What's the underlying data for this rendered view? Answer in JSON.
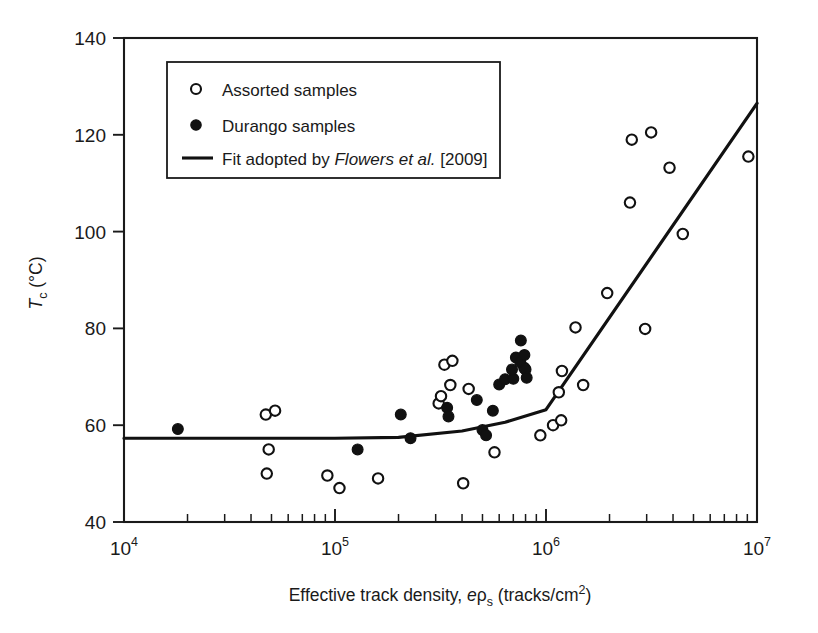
{
  "chart_data": {
    "type": "scatter",
    "title": "",
    "xlabel_parts": {
      "pre": "Effective track density, ",
      "e": "e",
      "rho": "ρ",
      "sub": "s",
      "post": " (tracks/cm",
      "sup": "2",
      "close": ")"
    },
    "xlabel": "Effective track density, eρs (tracks/cm2)",
    "ylabel_parts": {
      "t": "T",
      "sub": "c",
      "post": " (°C)"
    },
    "ylabel": "Tc (°C)",
    "xscale": "log",
    "xlim": [
      10000,
      10000000
    ],
    "ylim": [
      40,
      140
    ],
    "grid": false,
    "x_tick_labels": [
      "10⁴",
      "10⁵",
      "10⁶",
      "10⁷"
    ],
    "x_tick_mantissa": "10",
    "x_tick_exponents": [
      "4",
      "5",
      "6",
      "7"
    ],
    "x_tick_values": [
      10000,
      100000,
      1000000,
      10000000
    ],
    "y_ticks": [
      40,
      60,
      80,
      100,
      120,
      140
    ],
    "legend_position": "upper-left-inside",
    "series": [
      {
        "name": "Assorted samples",
        "marker": "open-circle",
        "color": "#111111",
        "points": [
          [
            47000,
            62.2
          ],
          [
            52000,
            63.0
          ],
          [
            48500,
            55.0
          ],
          [
            47500,
            50.0
          ],
          [
            92000,
            49.6
          ],
          [
            105000,
            47.0
          ],
          [
            160000,
            49.0
          ],
          [
            310000,
            64.5
          ],
          [
            318000,
            66.0
          ],
          [
            330000,
            72.5
          ],
          [
            360000,
            73.3
          ],
          [
            352000,
            68.3
          ],
          [
            405000,
            48.0
          ],
          [
            430000,
            67.5
          ],
          [
            570000,
            54.4
          ],
          [
            790000,
            71.8
          ],
          [
            940000,
            57.9
          ],
          [
            1080000,
            60.0
          ],
          [
            1180000,
            61.0
          ],
          [
            1150000,
            66.8
          ],
          [
            1190000,
            71.2
          ],
          [
            1500000,
            68.3
          ],
          [
            1380000,
            80.2
          ],
          [
            1950000,
            87.3
          ],
          [
            2500000,
            106.0
          ],
          [
            2550000,
            119.0
          ],
          [
            3150000,
            120.5
          ],
          [
            2950000,
            79.9
          ],
          [
            3850000,
            113.2
          ],
          [
            4450000,
            99.5
          ],
          [
            9100000,
            115.5
          ]
        ]
      },
      {
        "name": "Durango samples",
        "marker": "filled-circle",
        "color": "#111111",
        "points": [
          [
            18000,
            59.2
          ],
          [
            128000,
            55.0
          ],
          [
            205000,
            62.2
          ],
          [
            228000,
            57.3
          ],
          [
            340000,
            63.6
          ],
          [
            345000,
            61.8
          ],
          [
            470000,
            65.2
          ],
          [
            500000,
            59.0
          ],
          [
            520000,
            57.9
          ],
          [
            560000,
            63.0
          ],
          [
            600000,
            68.4
          ],
          [
            640000,
            69.5
          ],
          [
            700000,
            69.6
          ],
          [
            690000,
            71.5
          ],
          [
            720000,
            74.0
          ],
          [
            755000,
            73.0
          ],
          [
            760000,
            77.5
          ],
          [
            790000,
            74.5
          ],
          [
            800000,
            71.5
          ],
          [
            810000,
            69.8
          ]
        ]
      }
    ],
    "fit": {
      "name": "Fit adopted by Flowers et al. [2009]",
      "style": "solid-line",
      "color": "#111111",
      "points": [
        [
          10000,
          57.3
        ],
        [
          100000,
          57.3
        ],
        [
          200000,
          57.5
        ],
        [
          400000,
          58.8
        ],
        [
          640000,
          60.6
        ],
        [
          1000000,
          63.2
        ],
        [
          10000000,
          126.5
        ]
      ]
    },
    "legend": {
      "items": [
        {
          "label": "Assorted samples",
          "marker": "open-circle"
        },
        {
          "label": "Durango samples",
          "marker": "filled-circle"
        },
        {
          "label_pre": "Fit adopted by ",
          "label_italic": "Flowers et al.",
          "label_post": " [2009]",
          "marker": "line"
        }
      ]
    }
  }
}
